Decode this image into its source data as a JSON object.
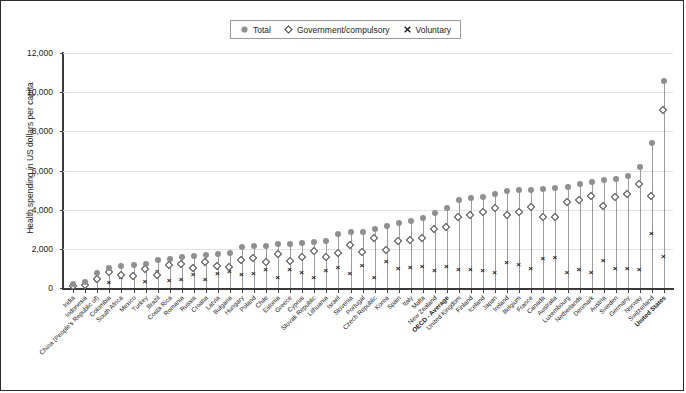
{
  "legend": {
    "items": [
      {
        "label": "Total",
        "symbol": "filled-circle"
      },
      {
        "label": "Government/compulsory",
        "symbol": "open-diamond"
      },
      {
        "label": "Voluntary",
        "symbol": "x-mark"
      }
    ]
  },
  "axes": {
    "ylabel": "Health spending in US dollars per capita",
    "yticks": [
      "0",
      "2,000",
      "4,000",
      "6,000",
      "8,000",
      "10,000",
      "12,000"
    ],
    "ytick_values": [
      0,
      2000,
      4000,
      6000,
      8000,
      10000,
      12000
    ]
  },
  "chart_data": {
    "type": "scatter",
    "title": "",
    "xlabel": "",
    "ylabel": "Health spending in US dollars per capita",
    "ylim": [
      0,
      12000
    ],
    "grid": true,
    "legend_position": "top-center",
    "categories": [
      "India",
      "Indonesia",
      "China (People's Republic of)",
      "Colombia",
      "South Africa",
      "Mexico",
      "Turkey",
      "Brazil",
      "Costa Rica",
      "Romania",
      "Russia",
      "Croatia",
      "Latvia",
      "Bulgaria",
      "Hungary",
      "Poland",
      "Chile",
      "Estonia",
      "Greece",
      "Cyprus",
      "Slovak Republic",
      "Lithuania",
      "Israel",
      "Slovenia",
      "Portugal",
      "Czech Republic",
      "Korea",
      "Spain",
      "Italy",
      "Malta",
      "New Zealand",
      "OECD - Average",
      "United Kingdom",
      "Finland",
      "Iceland",
      "Japan",
      "Ireland",
      "Belgium",
      "France",
      "Canada",
      "Australia",
      "Luxembourg",
      "Netherlands",
      "Denmark",
      "Austria",
      "Sweden",
      "Germany",
      "Norway",
      "Switzerland",
      "United States"
    ],
    "bold_categories": [
      "OECD - Average",
      "United States"
    ],
    "series": [
      {
        "name": "Total",
        "symbol": "filled-circle",
        "values": [
          210,
          330,
          790,
          1020,
          1130,
          1150,
          1230,
          1430,
          1500,
          1570,
          1620,
          1710,
          1750,
          1800,
          2070,
          2150,
          2170,
          2240,
          2250,
          2300,
          2350,
          2410,
          2780,
          2860,
          2870,
          3030,
          3190,
          3320,
          3420,
          3570,
          3830,
          4090,
          4500,
          4580,
          4670,
          4820,
          4960,
          5000,
          5020,
          5050,
          5100,
          5140,
          5330,
          5400,
          5500,
          5550,
          5700,
          6190,
          7380,
          10590
        ]
      },
      {
        "name": "Government/compulsory",
        "symbol": "open-diamond",
        "values": [
          60,
          110,
          450,
          770,
          650,
          570,
          960,
          630,
          1160,
          1180,
          970,
          1320,
          1070,
          1030,
          1420,
          1480,
          1280,
          1730,
          1340,
          1570,
          1880,
          1570,
          1780,
          2180,
          1790,
          2540,
          1900,
          2390,
          2430,
          2500,
          2980,
          3060,
          3620,
          3690,
          3840,
          4070,
          3700,
          3830,
          4100,
          3600,
          3600,
          4380,
          4440,
          4650,
          4140,
          4630,
          4760,
          5290,
          4670,
          9050
        ]
      },
      {
        "name": "Voluntary",
        "symbol": "x-mark",
        "values": [
          150,
          220,
          340,
          250,
          480,
          580,
          270,
          800,
          340,
          390,
          650,
          390,
          680,
          770,
          650,
          670,
          890,
          510,
          910,
          730,
          470,
          840,
          1000,
          680,
          1080,
          490,
          1290,
          930,
          990,
          1070,
          850,
          1030,
          880,
          890,
          830,
          750,
          1260,
          1170,
          920,
          1450,
          1500,
          760,
          890,
          750,
          1360,
          920,
          940,
          900,
          2710,
          1540
        ]
      }
    ]
  },
  "colors": {
    "total_marker": "#8f8f8f",
    "gov_marker_edge": "#4a4a4a",
    "vol_marker": "#1a1a1a",
    "stem": "#9b9b9b",
    "gridline": "#e3e3e3",
    "axis": "#3a3a3a",
    "frame": "#2b2b2b"
  }
}
